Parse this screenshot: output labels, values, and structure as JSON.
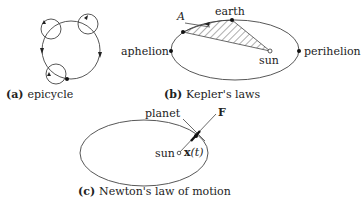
{
  "panels": {
    "a": {
      "tag": "(a)",
      "caption": "epicycle"
    },
    "b": {
      "tag": "(b)",
      "caption": "Kepler's laws",
      "labels": {
        "area": "A",
        "earth": "earth",
        "sun": "sun",
        "aphelion": "aphelion",
        "perihelion": "perihelion"
      }
    },
    "c": {
      "tag": "(c)",
      "caption": "Newton's law of motion",
      "labels": {
        "planet": "planet",
        "force": "F",
        "sun": "sun",
        "position": "x",
        "position_arg": "(t)"
      }
    }
  }
}
